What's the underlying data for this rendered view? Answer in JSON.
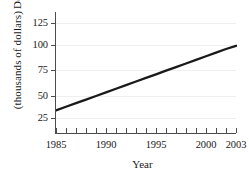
{
  "chart_data": {
    "type": "line",
    "title": "",
    "xlabel": "Year",
    "ylabel": "Debt (thousands of dollars)",
    "ylabel_line1": "Debt",
    "ylabel_line2": "(thousands of dollars)",
    "xlim": [
      1985,
      2003
    ],
    "ylim": [
      0,
      131
    ],
    "grid": true,
    "legend": "none",
    "x_tick_labels": [
      "1985",
      "1990",
      "1995",
      "2000",
      "2003"
    ],
    "x_tick_values": [
      1985,
      1990,
      1995,
      2000,
      2003
    ],
    "x_minor_ticks": [
      1985,
      1986,
      1987,
      1988,
      1989,
      1990,
      1991,
      1992,
      1993,
      1994,
      1995,
      1996,
      1997,
      1998,
      1999,
      2000,
      2001,
      2002,
      2003
    ],
    "y_tick_labels": [
      "25",
      "50",
      "75",
      "100",
      "125"
    ],
    "y_tick_values": [
      25,
      50,
      75,
      100,
      125
    ],
    "series": [
      {
        "name": "Debt",
        "color": "#1a1a1a",
        "x": [
          1985,
          1986,
          1987,
          1988,
          1989,
          1990,
          1991,
          1992,
          1993,
          1994,
          1995,
          1996,
          1997,
          1998,
          1999,
          2000,
          2001,
          2002,
          2003
        ],
        "values": [
          33,
          36.8,
          40.6,
          44.4,
          48.2,
          52,
          55.8,
          59.6,
          63.4,
          67.2,
          71,
          74.8,
          78.6,
          82.4,
          86.2,
          90,
          93.8,
          97.6,
          101
        ]
      }
    ],
    "colors": {
      "line": "#1a1a1a",
      "axis": "#4d4d4d",
      "grid": "#efefef",
      "background": "#ffffff",
      "text": "#1a1a1a"
    }
  }
}
